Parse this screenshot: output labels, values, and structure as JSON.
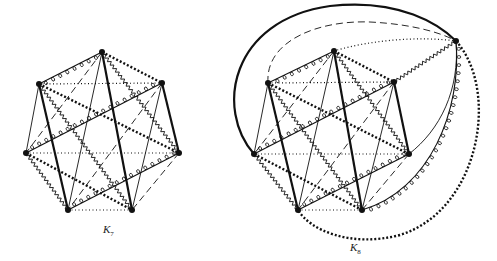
{
  "figure": {
    "graphs": [
      {
        "id": "k7",
        "label": "K",
        "subscript": "7",
        "label_pos": [
          103,
          233
        ],
        "vertices": [
          [
            102,
            52
          ],
          [
            162,
            83
          ],
          [
            179,
            153
          ],
          [
            132,
            210
          ],
          [
            68,
            210
          ],
          [
            26,
            153
          ],
          [
            39,
            84
          ]
        ],
        "edges": {
          "thick": [
            [
              0,
              3
            ],
            [
              6,
              4
            ],
            [
              1,
              2
            ]
          ],
          "loops": [
            [
              0,
              6
            ],
            [
              5,
              1
            ],
            [
              4,
              2
            ]
          ],
          "dotted": [
            [
              6,
              1
            ],
            [
              5,
              2
            ],
            [
              4,
              3
            ]
          ],
          "squares": [
            [
              0,
              1
            ],
            [
              6,
              2
            ],
            [
              5,
              3
            ]
          ],
          "zigzag": [
            [
              0,
              2
            ],
            [
              6,
              3
            ],
            [
              5,
              4
            ]
          ],
          "thin": [
            [
              0,
              4
            ],
            [
              6,
              5
            ],
            [
              1,
              3
            ]
          ],
          "dashed": [
            [
              0,
              5
            ],
            [
              1,
              4
            ],
            [
              2,
              3
            ]
          ]
        }
      },
      {
        "id": "k8",
        "label": "K",
        "subscript": "8",
        "label_pos": [
          350,
          243
        ],
        "vertices": [
          [
            334,
            51
          ],
          [
            394,
            82
          ],
          [
            409,
            154
          ],
          [
            362,
            210
          ],
          [
            298,
            210
          ],
          [
            254,
            154
          ],
          [
            268,
            83
          ],
          [
            456,
            41
          ]
        ],
        "edges": {
          "thick": [
            [
              0,
              3
            ],
            [
              6,
              4
            ],
            [
              1,
              2
            ]
          ],
          "loops": [
            [
              0,
              6
            ],
            [
              5,
              1
            ],
            [
              4,
              2
            ]
          ],
          "dotted": [
            [
              6,
              1
            ],
            [
              5,
              2
            ],
            [
              4,
              3
            ]
          ],
          "squares": [
            [
              0,
              1
            ],
            [
              6,
              2
            ],
            [
              5,
              3
            ]
          ],
          "zigzag": [
            [
              0,
              2
            ],
            [
              6,
              3
            ],
            [
              5,
              4
            ],
            [
              1,
              7
            ]
          ],
          "thin": [
            [
              0,
              4
            ],
            [
              6,
              5
            ],
            [
              1,
              3
            ]
          ],
          "dashed": [
            [
              0,
              5
            ],
            [
              1,
              4
            ],
            [
              2,
              3
            ]
          ]
        },
        "outer_curves": [
          {
            "style": "thick-solid",
            "from": 5,
            "to": 7,
            "d": "M254,154 C215,110 230,20 330,6 C400,-2 440,25 456,41"
          },
          {
            "style": "dashed",
            "from": 6,
            "to": 7,
            "d": "M268,83 C265,40 320,20 370,22 C410,24 440,32 456,41"
          },
          {
            "style": "dotted",
            "from": 0,
            "to": 7,
            "d": "M334,51 C370,40 420,36 456,41"
          },
          {
            "style": "thin",
            "from": 7,
            "to": 2,
            "d": "M456,41 C460,90 440,130 409,154"
          },
          {
            "style": "loops",
            "from": 7,
            "to": 3,
            "d": "M456,41 C462,110 430,190 362,210"
          },
          {
            "style": "squares",
            "from": 7,
            "to": 4,
            "d": "M456,41 C500,90 480,210 400,235 C350,248 310,230 298,210"
          }
        ]
      }
    ],
    "colors": {
      "ink": "#111111",
      "background": "#ffffff"
    }
  }
}
